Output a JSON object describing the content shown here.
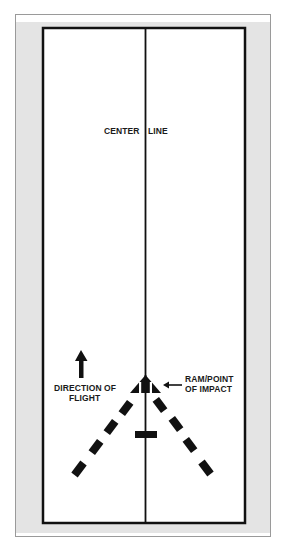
{
  "figure": {
    "type": "runway impact diagram",
    "labels": {
      "center_line_left": "CENTER",
      "center_line_right": "LINE",
      "direction_line1": "DIRECTION OF",
      "direction_line2": "FLIGHT",
      "impact_line1": "RAM/POINT",
      "impact_line2": "OF IMPACT"
    },
    "caption_visible": "",
    "colors": {
      "ink": "#111111",
      "background_gray": "#e4e4e4",
      "runway_fill": "#ffffff",
      "frame_border": "#9a9a9a"
    },
    "elements": {
      "runway_outline": "black rectangle",
      "center_line": "vertical line through runway",
      "direction_arrow": "up-arrow",
      "ram_marker": "striped triangle at point of impact",
      "impact_pointer": "left-arrow",
      "dashed_v_tracks": "two dashed diagonal lines diverging downward",
      "center_bar": "short horizontal bar on center line"
    }
  }
}
